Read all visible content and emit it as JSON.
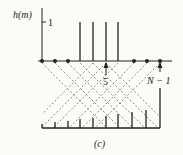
{
  "figure": {
    "y_axis_label": "h(m)",
    "y_tick_label": "1",
    "marker_5_label": "5",
    "marker_n1_label": "N − 1",
    "caption": "(c)",
    "ink_color": "#222222",
    "background": "#fbfbf8"
  },
  "top_sequence": {
    "positions_x": [
      42,
      55,
      68,
      80,
      93,
      106,
      118,
      132,
      146,
      160
    ],
    "stems_at_index": [
      3,
      4,
      5,
      6
    ],
    "dots_at_index": [
      0,
      1,
      2,
      7,
      8,
      9
    ]
  },
  "bottom_sequence": {
    "positions_x": [
      42,
      55,
      68,
      80,
      93,
      106,
      118,
      132,
      146,
      160
    ],
    "heights": [
      4,
      6,
      7,
      9,
      10,
      12,
      14,
      16,
      18,
      40
    ]
  }
}
